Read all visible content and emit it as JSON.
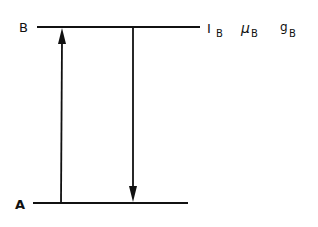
{
  "diagram": {
    "levels": [
      {
        "name": "B",
        "label": "B",
        "properties": {
          "spin": "I",
          "moment": "μ",
          "gfactor": "g",
          "subscript": "B"
        }
      },
      {
        "name": "A",
        "label": "A"
      }
    ],
    "transitions": [
      {
        "from": "A",
        "to": "B",
        "direction": "up"
      },
      {
        "from": "B",
        "to": "A",
        "direction": "down"
      }
    ],
    "colors": {
      "line": "#111111",
      "background": "#ffffff"
    }
  }
}
